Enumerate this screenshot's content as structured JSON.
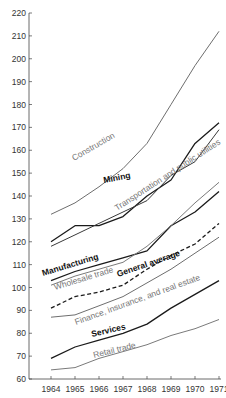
{
  "chart_data": {
    "type": "line",
    "title": "",
    "xlabel": "",
    "ylabel": "",
    "x": [
      1964,
      1965,
      1966,
      1967,
      1968,
      1969,
      1970,
      1971
    ],
    "ylim": [
      60,
      220
    ],
    "yticks": [
      60,
      70,
      80,
      90,
      100,
      110,
      120,
      130,
      140,
      150,
      160,
      170,
      180,
      190,
      200,
      210,
      220
    ],
    "grid": false,
    "legend": "inline labels along lines",
    "series": [
      {
        "name": "Construction",
        "color": "#6e6e6e",
        "dash": false,
        "bold": false,
        "values": [
          132,
          137,
          144,
          152,
          163,
          180,
          197,
          212
        ]
      },
      {
        "name": "Mining",
        "color": "#1a1a1a",
        "dash": false,
        "bold": true,
        "values": [
          120,
          127,
          127,
          131,
          140,
          147,
          163,
          172
        ]
      },
      {
        "name": "Transportation and public utilities",
        "color": "#3a3a3a",
        "dash": false,
        "bold": false,
        "values": [
          118,
          123,
          128,
          133,
          138,
          149,
          155,
          169
        ]
      },
      {
        "name": "Manufacturing",
        "color": "#1a1a1a",
        "dash": false,
        "bold": true,
        "values": [
          103,
          107,
          110,
          113,
          116,
          127,
          133,
          142
        ]
      },
      {
        "name": "Wholesale trade",
        "color": "#7a7a7a",
        "dash": false,
        "bold": false,
        "values": [
          101,
          105,
          108,
          111,
          118,
          127,
          137,
          146
        ]
      },
      {
        "name": "General average",
        "color": "#1a1a1a",
        "dash": true,
        "bold": true,
        "values": [
          91,
          96,
          98,
          101,
          108,
          114,
          119,
          128
        ]
      },
      {
        "name": "Finance, insurance, and real estate",
        "color": "#6e6e6e",
        "dash": false,
        "bold": false,
        "values": [
          87,
          88,
          92,
          96,
          102,
          108,
          115,
          122
        ]
      },
      {
        "name": "Services",
        "color": "#1a1a1a",
        "dash": false,
        "bold": true,
        "values": [
          69,
          74,
          77,
          80,
          84,
          91,
          97,
          103
        ]
      },
      {
        "name": "Retail trade",
        "color": "#7a7a7a",
        "dash": false,
        "bold": false,
        "values": [
          64,
          65,
          69,
          72,
          75,
          79,
          82,
          86
        ]
      }
    ]
  },
  "labels": {
    "construction": "Construction",
    "mining": "Mining",
    "transportation": "Transportation and public utilities",
    "manufacturing": "Manufacturing",
    "wholesale": "Wholesale trade",
    "general": "General average",
    "finance": "Finance, insurance, and real estate",
    "services": "Services",
    "retail": "Retail trade"
  }
}
